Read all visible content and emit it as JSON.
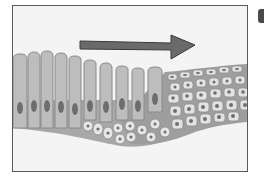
{
  "diagram": {
    "panel_letter_visible": "partial",
    "arrow": {
      "direction": "right",
      "color": "#6a6a6a"
    },
    "regions": [
      {
        "name": "columnar-epithelium",
        "side": "left",
        "cell_count": 10
      },
      {
        "name": "reserve-cells",
        "side": "middle-bottom"
      },
      {
        "name": "stratified-squamous-epithelium",
        "side": "right"
      }
    ],
    "colors": {
      "background": "#f4f4f4",
      "frame": "#5a5a5a",
      "column_cell": "#bdbdbd",
      "column_outline": "#8a8a8a",
      "nucleus": "#6e6e6e",
      "small_cell": "#e6e6e6",
      "basement": "#a8a8a8"
    }
  }
}
